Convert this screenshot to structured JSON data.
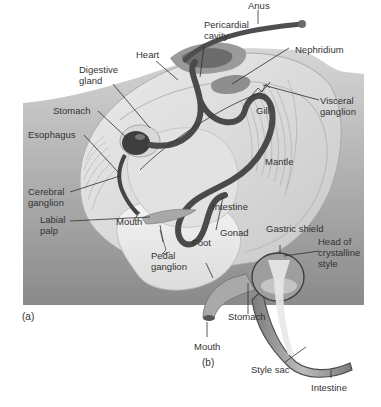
{
  "figure": {
    "panel_a_tag": "(a)",
    "panel_b_tag": "(b)",
    "colors": {
      "panel_top": "#d2d2d2",
      "panel_bottom": "#8c8c8c",
      "shell_light": "#e6e6e6",
      "foot": "#eeeeee",
      "intestine": "#555555",
      "heart": "#6a6a6a",
      "label_text": "#333333"
    }
  },
  "labels_a": {
    "anus": "Anus",
    "pericardial_cavity": "Pericardial\ncavity",
    "heart": "Heart",
    "nephridium": "Nephridium",
    "digestive_gland": "Digestive\ngland",
    "stomach": "Stomach",
    "gill": "Gill",
    "visceral_ganglion": "Visceral\nganglion",
    "esophagus": "Esophagus",
    "mantle": "Mantle",
    "cerebral_ganglion": "Cerebral\nganglion",
    "intestine": "Intestine",
    "labial_palp": "Labial\npalp",
    "mouth": "Mouth",
    "gonad": "Gonad",
    "foot": "Foot",
    "pedal_ganglion": "Pedal\nganglion"
  },
  "labels_b": {
    "gastric_shield": "Gastric shield",
    "head_of_crystalline_style": "Head of\ncrystalline\nstyle",
    "stomach": "Stomach",
    "mouth": "Mouth",
    "style_sac": "Style sac",
    "intestine": "Intestine"
  }
}
